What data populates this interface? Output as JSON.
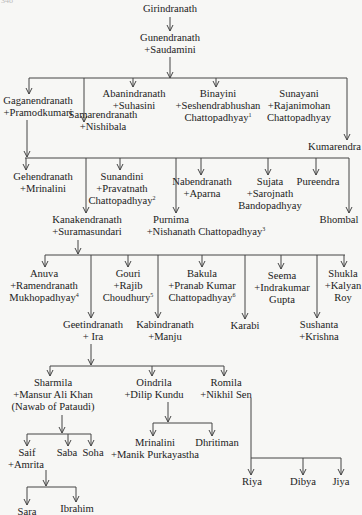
{
  "page_number": "348",
  "people": {
    "girindranath": {
      "name": "Girindranath"
    },
    "gunendranath": {
      "name": "Gunendranath",
      "spouse": "+Saudamini"
    },
    "gaganendranath": {
      "name": "Gaganendranath",
      "spouse": "+Pramodkumari"
    },
    "samarendranath": {
      "name": "Samarendranath",
      "spouse": "+Nishibala"
    },
    "abanindranath": {
      "name": "Abanindranath",
      "spouse": "+Suhasini"
    },
    "binayini": {
      "name": "Binayini",
      "spouse": "+Seshendrabhushan",
      "spouse2": "Chattopadhyay",
      "note": "1"
    },
    "sunayani": {
      "name": "Sunayani",
      "spouse": "+Rajanimohan",
      "spouse2": "Chattopadhyay"
    },
    "kumarendra": {
      "name": "Kumarendra"
    },
    "gehendranath": {
      "name": "Gehendranath",
      "spouse": "+Mrinalini"
    },
    "sunandini": {
      "name": "Sunandini",
      "spouse": "+Pravatnath",
      "spouse2": "Chattopadhyay",
      "note": "2"
    },
    "nabendranath": {
      "name": "Nabendranath",
      "spouse": "+Aparna"
    },
    "sujata": {
      "name": "Sujata",
      "spouse": "+Sarojnath",
      "spouse2": "Bandopadhyay"
    },
    "pureendra": {
      "name": "Pureendra"
    },
    "kanakendranath": {
      "name": "Kanakendranath",
      "spouse": "+Suramasundari"
    },
    "purnima": {
      "name": "Purnima",
      "spouse": "+Nishanath Chattopadhyay",
      "note": "3"
    },
    "bhombal": {
      "name": "Bhombal"
    },
    "anuva": {
      "name": "Anuva",
      "spouse": "+Ramendranath",
      "spouse2": "Mukhopadhyay",
      "note": "4"
    },
    "gouri": {
      "name": "Gouri",
      "spouse": "+Rajib",
      "spouse2": "Choudhury",
      "note": "5"
    },
    "bakula": {
      "name": "Bakula",
      "spouse": "+Pranab Kumar",
      "spouse2": "Chattopadhyay",
      "note": "6"
    },
    "seema": {
      "name": "Seema",
      "spouse": "+Indrakumar",
      "spouse2": "Gupta"
    },
    "shukla": {
      "name": "Shukla",
      "spouse": "+Kalyan",
      "spouse2": "Roy"
    },
    "geetindranath": {
      "name": "Geetindranath",
      "spouse": "+ Ira"
    },
    "kabindranath": {
      "name": "Kabindranath",
      "spouse": "+Manju"
    },
    "karabi": {
      "name": "Karabi"
    },
    "sushanta": {
      "name": "Sushanta",
      "spouse": "+Krishna"
    },
    "sharmila": {
      "name": "Sharmila",
      "spouse": "+Mansur Ali Khan",
      "spouse2": "(Nawab of Pataudi)"
    },
    "oindrila": {
      "name": "Oindrila",
      "spouse": "+Dilip Kundu"
    },
    "romila": {
      "name": "Romila",
      "spouse": "+Nikhil Sen"
    },
    "saif": {
      "name": "Saif",
      "spouse": "+Amrita"
    },
    "saba": {
      "name": "Saba"
    },
    "soha": {
      "name": "Soha"
    },
    "mrinalini2": {
      "name": "Mrinalini",
      "spouse": "+Manik Purkayastha"
    },
    "dhritiman": {
      "name": "Dhritiman"
    },
    "riya": {
      "name": "Riya"
    },
    "dibya": {
      "name": "Dibya"
    },
    "jiya": {
      "name": "Jiya"
    },
    "sara": {
      "name": "Sara"
    },
    "ibrahim": {
      "name": "Ibrahim"
    }
  }
}
